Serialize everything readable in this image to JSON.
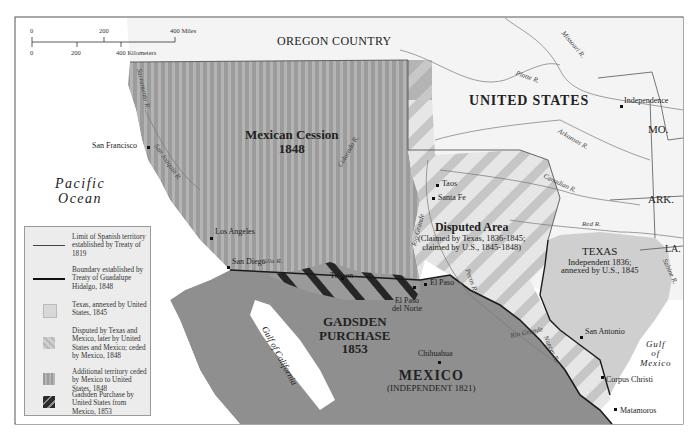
{
  "map": {
    "title_regions": {
      "oregon": "OREGON COUNTRY",
      "united_states": "UNITED STATES",
      "mexican_cession_title": "Mexican Cession",
      "mexican_cession_year": "1848",
      "disputed_title": "Disputed Area",
      "disputed_sub1": "(Claimed by Texas, 1836-1845;",
      "disputed_sub2": "claimed by U.S., 1845-1848)",
      "texas_title": "TEXAS",
      "texas_sub1": "Independent 1836;",
      "texas_sub2": "annexed by U.S., 1845",
      "gadsden_line1": "GADSDEN",
      "gadsden_line2": "PURCHASE",
      "gadsden_year": "1853",
      "mexico_title": "MEXICO",
      "mexico_sub": "(INDEPENDENT 1821)",
      "missouri_state": "MO.",
      "arkansas_state": "ARK.",
      "louisiana_state": "LA."
    },
    "water": {
      "pacific_line1": "Pacific",
      "pacific_line2": "Ocean",
      "gulf_mexico_line1": "Gulf",
      "gulf_mexico_line2": "of",
      "gulf_mexico_line3": "Mexico",
      "gulf_california_1": "Gulf",
      "gulf_california_2": "of",
      "gulf_california_3": "California"
    },
    "cities": {
      "san_francisco": "San Francisco",
      "los_angeles": "Los Angeles",
      "san_diego": "San Diego",
      "tucson": "Tucson",
      "el_paso": "El Paso",
      "el_paso_del_norte_1": "El Paso",
      "el_paso_del_norte_2": "del Norte",
      "taos": "Taos",
      "santa_fe": "Santa Fe",
      "independence": "Independence",
      "san_antonio": "San Antonio",
      "corpus_christi": "Corpus Christi",
      "matamoros": "Matamoros",
      "chihuahua": "Chihuahua"
    },
    "rivers": {
      "missouri": "Missouri R.",
      "platte": "Platte R.",
      "arkansas": "Arkansas R.",
      "canadian": "Canadian R.",
      "red": "Red R.",
      "sabine": "Sabine R.",
      "colorado": "Colorado R.",
      "rio_grande_north": "Rio Grande",
      "rio_grande_south": "Rio Grande",
      "pecos": "Pecos R.",
      "nueces": "Nueces R.",
      "gila": "Gila R.",
      "sacramento": "Sacramento R.",
      "san_joaquin": "San Joaquin R."
    },
    "scale": {
      "miles_ticks": [
        "0",
        "200",
        "400 Miles"
      ],
      "km_ticks": [
        "0",
        "200",
        "400 Kilometers"
      ]
    },
    "legend": {
      "items": [
        {
          "symbol": "thin-line",
          "text": "Limit of Spanish territory established by Treaty of 1819"
        },
        {
          "symbol": "thick-line",
          "text": "Boundary established by Treaty of Guadalupe Hidalgo, 1848"
        },
        {
          "symbol": "light-swatch",
          "text": "Texas, annexed by United States, 1845"
        },
        {
          "symbol": "diagonal-swatch",
          "text": "Disputed by Texas and Mexico, later by United States and Mexico; ceded by Mexico, 1848"
        },
        {
          "symbol": "vertical-stripe-swatch",
          "text": "Additional territory ceded by Mexico to United States, 1848"
        },
        {
          "symbol": "dark-diagonal-swatch",
          "text": "Gadsden Purchase by United States from Mexico, 1853"
        }
      ]
    },
    "colors": {
      "land_us": "#f4f4f4",
      "water": "#ffffff",
      "mexico": "#8f8f8f",
      "cession_a": "#9a9a9a",
      "cession_b": "#b0b0b0",
      "texas": "#cfcfcf",
      "disputed_a": "#e4e4e4",
      "disputed_b": "#c4c4c4",
      "gadsden_dark": "#2a2a2a",
      "border": "#1a1a1a"
    }
  }
}
